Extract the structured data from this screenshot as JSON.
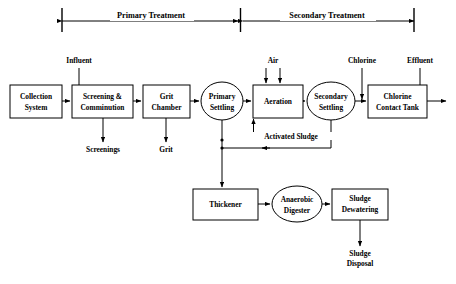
{
  "diagram": {
    "sections": [
      {
        "id": "primary",
        "label": "Primary Treatment",
        "x_start": 62,
        "x_end": 240,
        "label_x": 151,
        "label_y": 16
      },
      {
        "id": "secondary",
        "label": "Secondary Treatment",
        "x_start": 240,
        "x_end": 414,
        "label_x": 327,
        "label_y": 16
      }
    ],
    "nodes": [
      {
        "id": "collection-system",
        "label_lines": [
          "Collection",
          "System"
        ],
        "shape": "rect",
        "x": 10,
        "y": 85,
        "w": 52,
        "h": 33
      },
      {
        "id": "screening-comminution",
        "label_lines": [
          "Screening  &",
          "Comminution"
        ],
        "shape": "rect",
        "x": 72,
        "y": 85,
        "w": 61,
        "h": 33
      },
      {
        "id": "grit-chamber",
        "label_lines": [
          "Grit",
          "Chamber"
        ],
        "shape": "rect",
        "x": 143,
        "y": 85,
        "w": 47,
        "h": 33
      },
      {
        "id": "primary-settling",
        "label_lines": [
          "Primary",
          "Settling"
        ],
        "shape": "ellipse",
        "cx": 222,
        "cy": 101,
        "rx": 21,
        "ry": 19
      },
      {
        "id": "aeration",
        "label_lines": [
          "Aeration"
        ],
        "shape": "rect",
        "x": 253,
        "y": 85,
        "w": 50,
        "h": 33
      },
      {
        "id": "secondary-settling",
        "label_lines": [
          "Secondary",
          "Settling"
        ],
        "shape": "ellipse",
        "cx": 331,
        "cy": 101,
        "rx": 24,
        "ry": 19
      },
      {
        "id": "chlorine-contact-tank",
        "label_lines": [
          "Chlorine",
          "Contact Tank"
        ],
        "shape": "rect",
        "x": 368,
        "y": 85,
        "w": 59,
        "h": 33
      },
      {
        "id": "thickener",
        "label_lines": [
          "Thickener"
        ],
        "shape": "rect",
        "x": 193,
        "y": 189,
        "w": 65,
        "h": 31
      },
      {
        "id": "anaerobic-digester",
        "label_lines": [
          "Anaerobic",
          "Digester"
        ],
        "shape": "ellipse",
        "cx": 297,
        "cy": 204,
        "rx": 25,
        "ry": 18
      },
      {
        "id": "sludge-dewatering",
        "label_lines": [
          "Sludge",
          "Dewatering"
        ],
        "shape": "rect",
        "x": 332,
        "y": 189,
        "w": 56,
        "h": 31
      }
    ],
    "flow_labels": [
      {
        "id": "influent",
        "text": "Influent",
        "x": 79,
        "y": 63,
        "anchor": "middle"
      },
      {
        "id": "air",
        "text": "Air",
        "x": 273,
        "y": 63,
        "anchor": "middle"
      },
      {
        "id": "chlorine",
        "text": "Chlorine",
        "x": 362,
        "y": 63,
        "anchor": "middle"
      },
      {
        "id": "effluent",
        "text": "Effluent",
        "x": 420,
        "y": 63,
        "anchor": "middle"
      },
      {
        "id": "screenings",
        "text": "Screenings",
        "x": 103,
        "y": 150,
        "anchor": "middle"
      },
      {
        "id": "grit",
        "text": "Grit",
        "x": 166,
        "y": 150,
        "anchor": "middle"
      },
      {
        "id": "activated-sludge",
        "text": "Activated Sludge",
        "x": 291,
        "y": 137,
        "anchor": "middle"
      },
      {
        "id": "sludge-disposal-1",
        "text": "Sludge",
        "x": 360,
        "y": 254,
        "anchor": "middle"
      },
      {
        "id": "sludge-disposal-2",
        "text": "Disposal",
        "x": 360,
        "y": 263,
        "anchor": "middle"
      }
    ],
    "connections": [
      {
        "id": "collection-to-screening",
        "from": "collection-system",
        "to": "screening-comminution"
      },
      {
        "id": "screening-to-grit",
        "from": "screening-comminution",
        "to": "grit-chamber"
      },
      {
        "id": "grit-to-primary",
        "from": "grit-chamber",
        "to": "primary-settling"
      },
      {
        "id": "primary-to-aeration",
        "from": "primary-settling",
        "to": "aeration"
      },
      {
        "id": "aeration-to-secondary",
        "from": "aeration",
        "to": "secondary-settling"
      },
      {
        "id": "secondary-to-chlorine-tank",
        "from": "secondary-settling",
        "to": "chlorine-contact-tank"
      },
      {
        "id": "chlorine-tank-to-effluent",
        "from": "chlorine-contact-tank",
        "to": "outfall"
      },
      {
        "id": "influent-input",
        "from": "influent",
        "to": "screening-comminution"
      },
      {
        "id": "air-input-left",
        "from": "air",
        "to": "aeration"
      },
      {
        "id": "air-input-right",
        "from": "air",
        "to": "aeration"
      },
      {
        "id": "chlorine-input",
        "from": "chlorine",
        "to": "chlorine-contact-tank"
      },
      {
        "id": "effluent-input",
        "from": "effluent",
        "to": "outfall"
      },
      {
        "id": "screenings-waste",
        "from": "screening-comminution",
        "to": "screenings"
      },
      {
        "id": "grit-waste",
        "from": "grit-chamber",
        "to": "grit"
      },
      {
        "id": "return-activated-sludge",
        "from": "secondary-settling",
        "to": "aeration"
      },
      {
        "id": "waste-activated-sludge",
        "from": "secondary-settling",
        "to": "thickener"
      },
      {
        "id": "primary-sludge-to-thickener",
        "from": "primary-settling",
        "to": "thickener"
      },
      {
        "id": "thickener-to-digester",
        "from": "thickener",
        "to": "anaerobic-digester"
      },
      {
        "id": "digester-to-dewatering",
        "from": "anaerobic-digester",
        "to": "sludge-dewatering"
      },
      {
        "id": "dewatering-to-disposal",
        "from": "sludge-dewatering",
        "to": "sludge-disposal"
      }
    ],
    "colors": {
      "stroke": "#000000",
      "fill": "#ffffff",
      "background": "#ffffff"
    }
  }
}
